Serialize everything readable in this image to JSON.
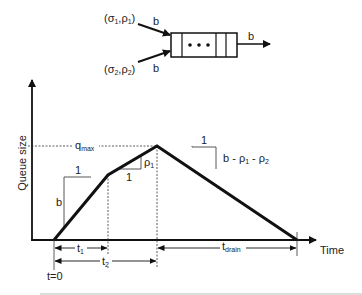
{
  "diagram": {
    "type": "queue-size-vs-time",
    "queue": {
      "inputs": [
        {
          "label": "(σ1,ρ1)",
          "sigma_sub": "1",
          "rho_sub": "1",
          "rate_label": "b"
        },
        {
          "label": "(σ2,ρ2)",
          "sigma_sub": "2",
          "rho_sub": "2",
          "rate_label": "b"
        }
      ],
      "output_rate_label": "b",
      "buffer_dots": "•••"
    },
    "axes": {
      "y_label": "Queue size",
      "x_label": "Time"
    },
    "annotations": {
      "qmax": "q",
      "qmax_sub": "max",
      "slope1_run": "1",
      "slope1_rise": "b",
      "slope2_run": "1",
      "slope2_rise": "ρ",
      "slope2_rise_sub": "1",
      "slope3_run": "1",
      "slope3_rise": "b - ρ1 - ρ2",
      "t0": "t=0",
      "t1": "t",
      "t1_sub": "1",
      "t2": "t",
      "t2_sub": "2",
      "tdrain": "t",
      "tdrain_sub": "drain"
    },
    "curve_points": [
      [
        54,
        240
      ],
      [
        108,
        175
      ],
      [
        157,
        146
      ],
      [
        297,
        240
      ]
    ]
  }
}
